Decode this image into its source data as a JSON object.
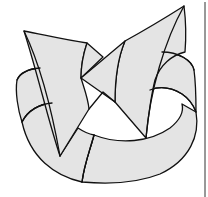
{
  "figure": {
    "colors": {
      "background": "#ffffff",
      "fill": "#e4e4e4",
      "stroke": "#111111",
      "frame": "#333333"
    },
    "parts": [
      {
        "name": "band",
        "label": "ring band"
      },
      {
        "name": "left-arrowhead",
        "label": "left arrowhead pointing up-left"
      },
      {
        "name": "right-arrowhead",
        "label": "right arrowhead pointing up-right"
      }
    ],
    "frame_line": {
      "x": 205,
      "y_start": 2,
      "y_end": 197
    }
  }
}
